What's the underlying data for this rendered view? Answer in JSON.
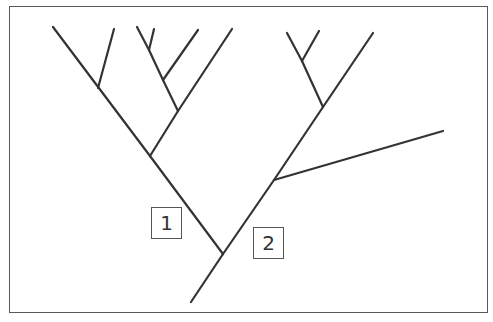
{
  "diagram": {
    "type": "phylogenetic-tree",
    "line_color": "#333333",
    "frame_color": "#5a5a5a",
    "labels": [
      {
        "id": "node-label-1",
        "text": "1"
      },
      {
        "id": "node-label-2",
        "text": "2"
      }
    ],
    "tree": {
      "description": "Cladogram with 9 terminal taxa; label 1 marks the branch leading to the left clade, label 2 marks the root trunk",
      "clades": [
        {
          "name": "left-clade",
          "leaves": 6
        },
        {
          "name": "right-clade",
          "leaves": 3
        }
      ]
    }
  }
}
